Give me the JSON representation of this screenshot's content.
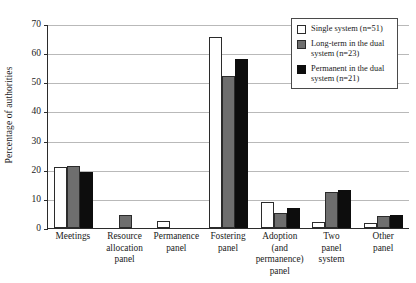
{
  "chart_data": {
    "type": "bar",
    "title": "",
    "xlabel": "",
    "ylabel": "Percentage of authorities",
    "ylim": [
      0,
      70
    ],
    "yticks": [
      70,
      60,
      50,
      40,
      30,
      20,
      10,
      0
    ],
    "grid": true,
    "legend_position": "top-right",
    "categories": [
      "Meetings",
      "Resource allocation panel",
      "Permanence panel",
      "Fostering panel",
      "Adoption (and permanence) panel",
      "Two panel system",
      "Other panel"
    ],
    "category_lines": [
      [
        "Meetings"
      ],
      [
        "Resource",
        "allocation",
        "panel"
      ],
      [
        "Permanence",
        "panel"
      ],
      [
        "Fostering",
        "panel"
      ],
      [
        "Adoption (and",
        "permanence)",
        "panel"
      ],
      [
        "Two",
        "panel",
        "system"
      ],
      [
        "Other",
        "panel"
      ]
    ],
    "series": [
      {
        "name": "Single system (n=51)",
        "key": "single",
        "color": "#ffffff",
        "values": [
          20.8,
          0,
          2.5,
          65.5,
          9,
          2,
          1.8
        ]
      },
      {
        "name": "Long-term in the dual system (n=23)",
        "key": "longterm",
        "color": "#6e6e6e",
        "values": [
          21.4,
          4.5,
          0,
          52,
          5.2,
          12.2,
          4
        ]
      },
      {
        "name": "Permanent in the dual system (n=21)",
        "key": "permanent",
        "color": "#0d0d0d",
        "values": [
          19.2,
          0,
          0,
          58,
          7,
          13.2,
          4.6
        ]
      }
    ]
  },
  "legend": {
    "items": [
      {
        "label": "Single system (n=51)",
        "key": "single"
      },
      {
        "label": "Long-term in the dual system (n=23)",
        "key": "longterm"
      },
      {
        "label": "Permanent in the dual system (n=21)",
        "key": "permanent"
      }
    ]
  }
}
